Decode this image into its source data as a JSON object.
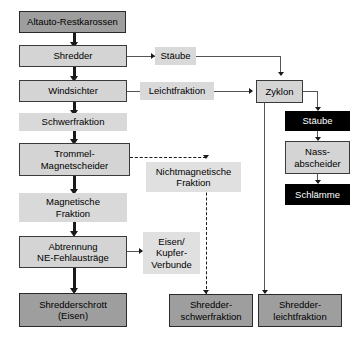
{
  "diagram": {
    "colors": {
      "process_fill": "#d4d4d4",
      "io_fill": "#9e9e9e",
      "tag_fill": "#d9d9d9",
      "black_fill": "#000000",
      "line": "#1a1a1a",
      "background": "#ffffff"
    },
    "nodes": {
      "altauto_restkarossen": "Altauto-Restkarossen",
      "shredder": "Shredder",
      "windsichter": "Windsichter",
      "schwerfraktion": "Schwerfraktion",
      "trommel_magnetscheider": "Trommel-\nMagnetscheider",
      "magnetische_fraktion": "Magnetische\nFraktion",
      "abtrennung_ne": "Abtrennung\nNE-Fehlausträge",
      "shredderschrott": "Shredderschrott\n(Eisen)",
      "staube_tag": "Stäube",
      "leichtfraktion": "Leichtfraktion",
      "zyklon": "Zyklon",
      "staube_box": "Stäube",
      "nassabscheider": "Nass-\nabscheider",
      "schlaemme": "Schlämme",
      "nichtmagnetische_fraktion": "Nichtmagnetische\nFraktion",
      "eisen_kupfer_verbunde": "Eisen/\nKupfer-\nVerbunde",
      "shredderschwerfraktion": "Shredder-\nschwerfraktion",
      "shredderleichtfraktion": "Shredder-\nleichtfraktion"
    }
  }
}
